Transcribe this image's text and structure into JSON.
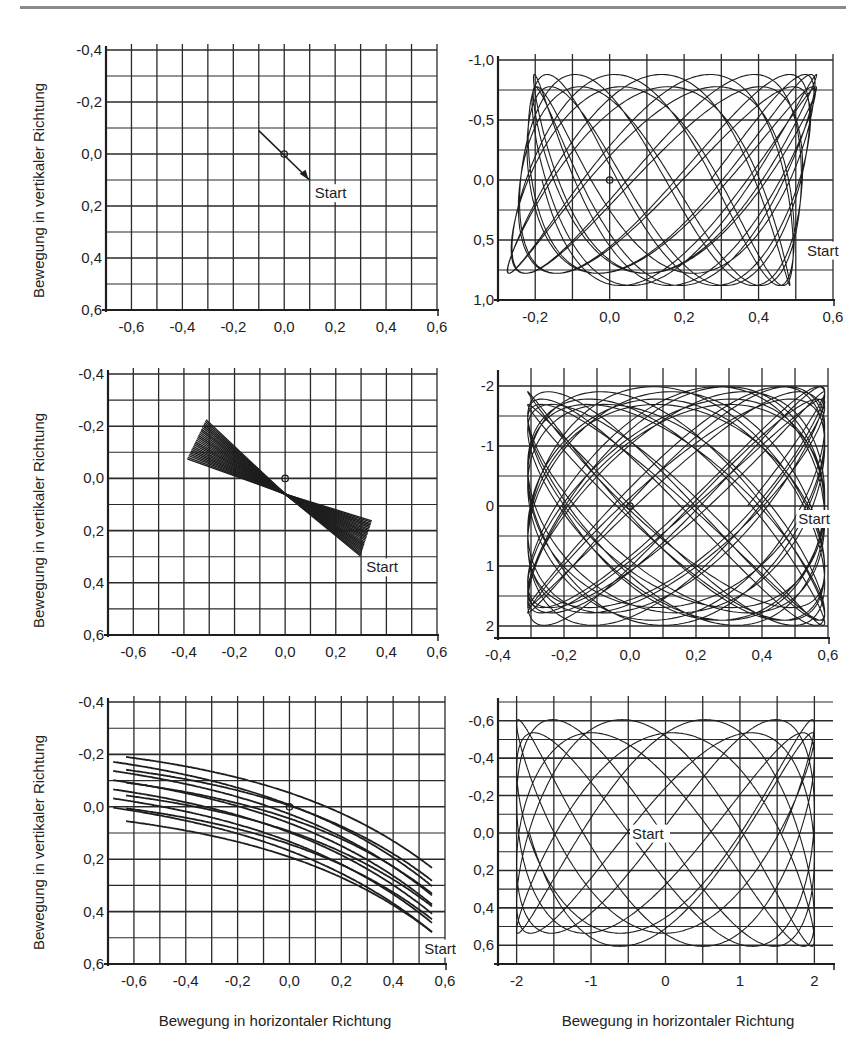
{
  "page": {
    "y_axis_label": "Bewegung in vertikaler Richtung",
    "x_axis_label": "Bewegung in horizontaler Richtung"
  },
  "chart_data": [
    {
      "id": "row1-left",
      "type": "line",
      "title": "",
      "xlabel": "",
      "ylabel": "Bewegung in vertikaler Richtung",
      "xlim": [
        -0.7,
        0.6
      ],
      "ylim": [
        -0.4,
        0.6
      ],
      "y_inverted": true,
      "grid": true,
      "x_ticks": [
        -0.6,
        -0.4,
        -0.2,
        0.0,
        0.2,
        0.4,
        0.6
      ],
      "x_tick_labels": [
        "-0,6",
        "-0,4",
        "-0,2",
        "0,0",
        "0,2",
        "0,4",
        "0,6"
      ],
      "y_ticks": [
        -0.4,
        -0.2,
        0.0,
        0.2,
        0.4,
        0.6
      ],
      "y_tick_labels": [
        "-0,4",
        "-0,2",
        "0,0",
        "0,2",
        "0,4",
        "0,6"
      ],
      "x_grid_step": 0.1,
      "y_grid_step": 0.1,
      "annotations": [
        {
          "text": "Start",
          "x": 0.12,
          "y": 0.17
        }
      ],
      "origin_marker": [
        0,
        0
      ],
      "trajectory": {
        "kind": "segment",
        "from": [
          -0.1,
          -0.09
        ],
        "to": [
          0.1,
          0.1
        ],
        "arrow_at": [
          0.08,
          0.08
        ]
      }
    },
    {
      "id": "row1-right",
      "type": "line",
      "title": "",
      "xlabel": "",
      "ylabel": "",
      "xlim": [
        -0.3,
        0.6
      ],
      "ylim": [
        -1.0,
        1.0
      ],
      "y_inverted": true,
      "grid": true,
      "x_ticks": [
        -0.2,
        0.0,
        0.2,
        0.4,
        0.6
      ],
      "x_tick_labels": [
        "-0,2",
        "0,0",
        "0,2",
        "0,4",
        "0,6"
      ],
      "y_ticks": [
        -1.0,
        -0.5,
        0.0,
        0.5,
        1.0
      ],
      "y_tick_labels": [
        "-1,0",
        "-0,5",
        "0,0",
        "0,5",
        "1,0"
      ],
      "x_grid_step": 0.1,
      "y_grid_step": 0.25,
      "annotations": [
        {
          "text": "Start",
          "x": 0.53,
          "y": 0.63
        }
      ],
      "origin_marker": [
        0,
        0
      ],
      "trajectory": {
        "kind": "lissajous",
        "ax": 0.38,
        "cx": 0.14,
        "fx": 1.0,
        "ay": 0.9,
        "cy": 0.0,
        "fy": 2.0,
        "phase": 0.35,
        "drift": 0.055,
        "turns": 11,
        "skew": 0.12
      }
    },
    {
      "id": "row2-left",
      "type": "line",
      "title": "",
      "xlabel": "",
      "ylabel": "Bewegung in vertikaler Richtung",
      "xlim": [
        -0.7,
        0.6
      ],
      "ylim": [
        -0.4,
        0.6
      ],
      "y_inverted": true,
      "grid": true,
      "x_ticks": [
        -0.6,
        -0.4,
        -0.2,
        0.0,
        0.2,
        0.4,
        0.6
      ],
      "x_tick_labels": [
        "-0,6",
        "-0,4",
        "-0,2",
        "0,0",
        "0,2",
        "0,4",
        "0,6"
      ],
      "y_ticks": [
        -0.4,
        -0.2,
        0.0,
        0.2,
        0.4,
        0.6
      ],
      "y_tick_labels": [
        "-0,4",
        "-0,2",
        "0,0",
        "0,2",
        "0,4",
        "0,6"
      ],
      "x_grid_step": 0.1,
      "y_grid_step": 0.1,
      "annotations": [
        {
          "text": "Start",
          "x": 0.32,
          "y": 0.36
        }
      ],
      "origin_marker": [
        0,
        0
      ],
      "trajectory": {
        "kind": "bowtie",
        "p1": [
          -0.35,
          -0.15
        ],
        "p2": [
          0.32,
          0.23
        ],
        "spread": 0.075,
        "lines": 26
      }
    },
    {
      "id": "row2-right",
      "type": "line",
      "title": "",
      "xlabel": "",
      "ylabel": "",
      "xlim": [
        -0.4,
        0.6
      ],
      "ylim": [
        -2.2,
        2.2
      ],
      "y_inverted": true,
      "grid": true,
      "x_ticks": [
        -0.4,
        -0.2,
        0.0,
        0.2,
        0.4,
        0.6
      ],
      "x_tick_labels": [
        "-0,4",
        "-0,2",
        "0,0",
        "0,2",
        "0,4",
        "0,6"
      ],
      "y_ticks": [
        -2,
        -1,
        0,
        1,
        2
      ],
      "y_tick_labels": [
        "-2",
        "-1",
        "0",
        "1",
        "2"
      ],
      "x_grid_step": 0.1,
      "y_grid_step": 0.5,
      "annotations": [
        {
          "text": "Start",
          "x": 0.51,
          "y": 0.3
        }
      ],
      "origin_marker": [
        0,
        0
      ],
      "trajectory": {
        "kind": "lissajous",
        "ax": 0.45,
        "cx": 0.14,
        "fx": 3.0,
        "ay": 2.0,
        "cy": 0.0,
        "fy": 4.0,
        "phase": 0.5,
        "drift": 0.08,
        "turns": 7,
        "skew": 0.0
      }
    },
    {
      "id": "row3-left",
      "type": "line",
      "title": "",
      "xlabel": "Bewegung in horizontaler Richtung",
      "ylabel": "Bewegung in vertikaler Richtung",
      "xlim": [
        -0.7,
        0.6
      ],
      "ylim": [
        -0.4,
        0.6
      ],
      "y_inverted": true,
      "grid": true,
      "x_ticks": [
        -0.6,
        -0.4,
        -0.2,
        0.0,
        0.2,
        0.4,
        0.6
      ],
      "x_tick_labels": [
        "-0,6",
        "-0,4",
        "-0,2",
        "0,0",
        "0,2",
        "0,4",
        "0,6"
      ],
      "y_ticks": [
        -0.4,
        -0.2,
        0.0,
        0.2,
        0.4,
        0.6
      ],
      "y_tick_labels": [
        "-0,4",
        "-0,2",
        "0,0",
        "0,2",
        "0,4",
        "0,6"
      ],
      "x_grid_step": 0.1,
      "y_grid_step": 0.1,
      "annotations": [
        {
          "text": "Start",
          "x": 0.52,
          "y": 0.56
        }
      ],
      "origin_marker": [
        0,
        0
      ],
      "trajectory": {
        "kind": "curved-band",
        "x_from": -0.68,
        "x_to": 0.55,
        "loops": 6
      }
    },
    {
      "id": "row3-right",
      "type": "line",
      "title": "",
      "xlabel": "Bewegung in horizontaler Richtung",
      "ylabel": "",
      "xlim": [
        -2.25,
        2.25
      ],
      "ylim": [
        -0.7,
        0.7
      ],
      "y_inverted": true,
      "grid": true,
      "x_ticks": [
        -2,
        -1,
        0,
        1,
        2
      ],
      "x_tick_labels": [
        "-2",
        "-1",
        "0",
        "1",
        "2"
      ],
      "y_ticks": [
        -0.6,
        -0.4,
        -0.2,
        0.0,
        0.2,
        0.4,
        0.6
      ],
      "y_tick_labels": [
        "-0,6",
        "-0,4",
        "-0,2",
        "0,0",
        "0,2",
        "0,4",
        "0,6"
      ],
      "x_grid_step": 0.5,
      "y_grid_step": 0.1,
      "annotations": [
        {
          "text": "Start",
          "x": -0.45,
          "y": 0.03
        }
      ],
      "origin_marker": [
        0,
        0
      ],
      "trajectory": {
        "kind": "lissajous",
        "ax": 2.0,
        "cx": 0.0,
        "fx": 1.0,
        "ay": 0.62,
        "cy": 0.0,
        "fy": 2.0,
        "phase": 0.9,
        "drift": 0.09,
        "turns": 6,
        "skew": 0.0
      }
    }
  ]
}
